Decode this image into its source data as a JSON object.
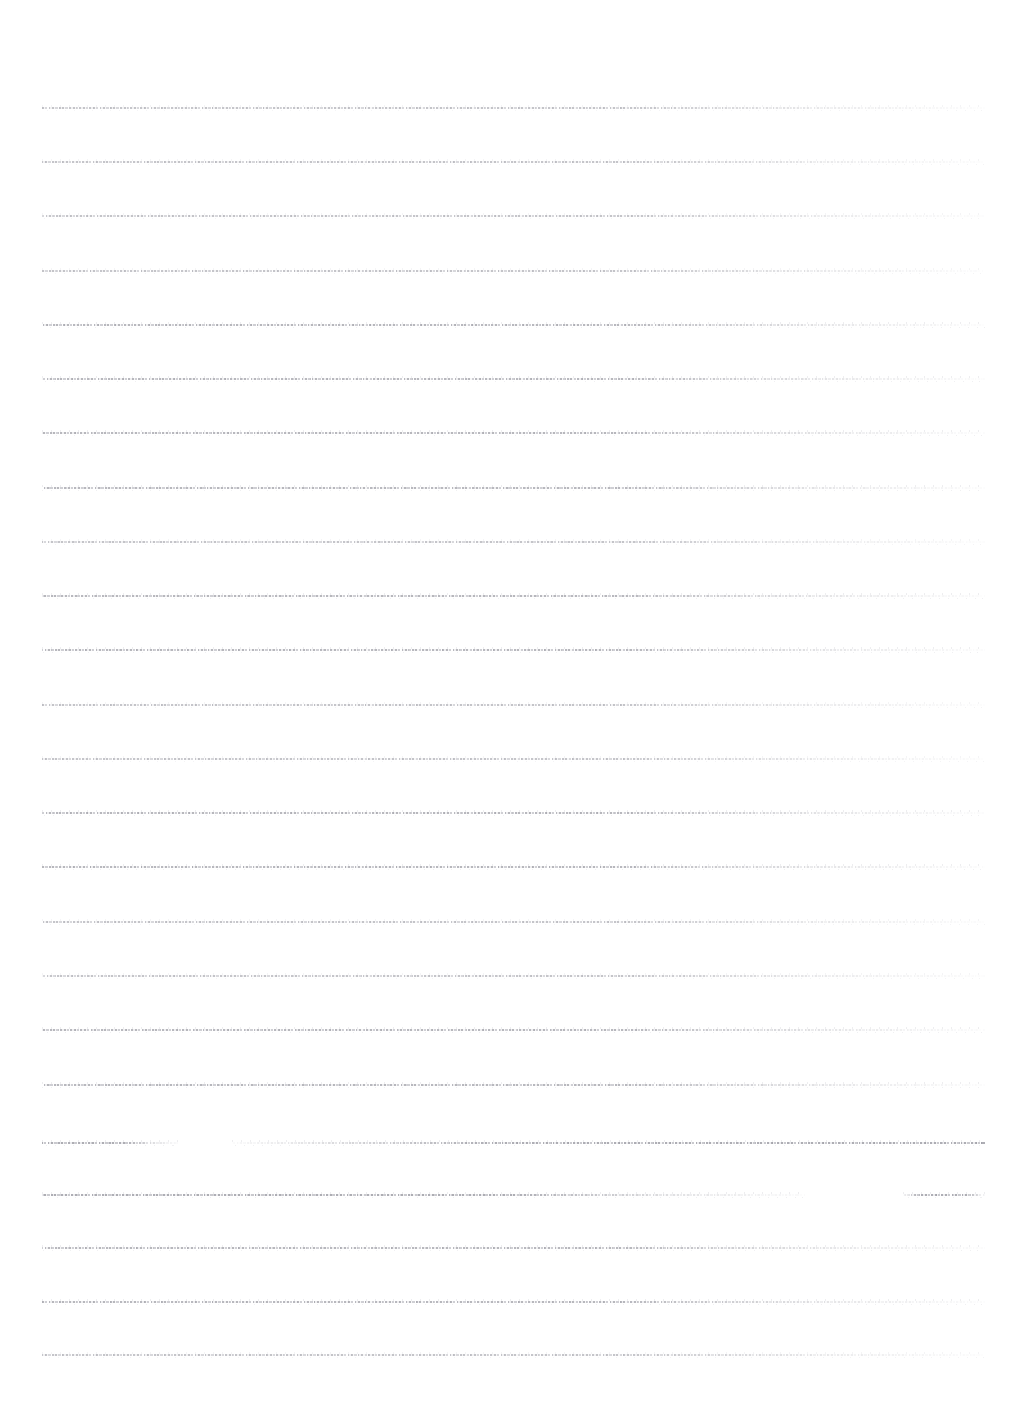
{
  "document": {
    "kind": "degraded-scanned-page",
    "page_width": 1027,
    "page_height": 1412,
    "background_color": "#ffffff",
    "ink_color": "#9696a0",
    "legibility": "illegible",
    "body_text": "",
    "margins": {
      "left": 42,
      "right": 42,
      "top": 108,
      "bottom": 57
    },
    "text_block": {
      "left": 42,
      "right": 985,
      "width": 943,
      "first_baseline": 108,
      "last_baseline": 1355
    },
    "typography": {
      "line_count": 24,
      "line_spacing": 54.2,
      "stroke_height": 2.2,
      "alignment": "justified"
    },
    "paragraphs": [
      {
        "index": 0,
        "start_line": 0,
        "end_line": 19
      },
      {
        "index": 1,
        "start_line": 19,
        "end_line": 21
      },
      {
        "index": 2,
        "start_line": 21,
        "end_line": 23
      }
    ],
    "lines": [
      {
        "y": 108,
        "density": "light",
        "runs": [
          {
            "x": 42,
            "w": 943,
            "fade": "tail-fade"
          }
        ]
      },
      {
        "y": 162,
        "density": "light",
        "runs": [
          {
            "x": 42,
            "w": 943,
            "fade": "tail-fade"
          }
        ]
      },
      {
        "y": 216,
        "density": "light",
        "runs": [
          {
            "x": 42,
            "w": 943,
            "fade": "tail-fade"
          }
        ]
      },
      {
        "y": 271,
        "density": "light",
        "runs": [
          {
            "x": 42,
            "w": 943,
            "fade": "tail-fade"
          }
        ]
      },
      {
        "y": 325,
        "density": "normal",
        "runs": [
          {
            "x": 42,
            "w": 943,
            "fade": "tail-fade"
          }
        ]
      },
      {
        "y": 379,
        "density": "normal",
        "runs": [
          {
            "x": 42,
            "w": 943,
            "fade": "tail-fade"
          }
        ]
      },
      {
        "y": 433,
        "density": "normal",
        "runs": [
          {
            "x": 42,
            "w": 943,
            "fade": "tail-fade"
          }
        ]
      },
      {
        "y": 488,
        "density": "normal",
        "runs": [
          {
            "x": 42,
            "w": 943,
            "fade": "tail-fade"
          }
        ]
      },
      {
        "y": 542,
        "density": "light",
        "runs": [
          {
            "x": 42,
            "w": 943,
            "fade": "tail-fade"
          }
        ]
      },
      {
        "y": 596,
        "density": "normal",
        "runs": [
          {
            "x": 42,
            "w": 943,
            "fade": "tail-fade"
          }
        ]
      },
      {
        "y": 650,
        "density": "normal",
        "runs": [
          {
            "x": 42,
            "w": 943,
            "fade": "tail-fade"
          }
        ]
      },
      {
        "y": 705,
        "density": "light",
        "runs": [
          {
            "x": 42,
            "w": 943,
            "fade": "tail-fade"
          }
        ]
      },
      {
        "y": 759,
        "density": "light",
        "runs": [
          {
            "x": 42,
            "w": 943,
            "fade": "tail-fade"
          }
        ]
      },
      {
        "y": 813,
        "density": "normal",
        "runs": [
          {
            "x": 42,
            "w": 943,
            "fade": "tail-fade"
          }
        ]
      },
      {
        "y": 867,
        "density": "normal",
        "runs": [
          {
            "x": 42,
            "w": 943,
            "fade": "tail-fade"
          }
        ]
      },
      {
        "y": 922,
        "density": "light",
        "runs": [
          {
            "x": 42,
            "w": 943,
            "fade": "tail-fade"
          }
        ]
      },
      {
        "y": 976,
        "density": "light",
        "runs": [
          {
            "x": 42,
            "w": 943,
            "fade": "tail-fade"
          }
        ]
      },
      {
        "y": 1030,
        "density": "normal",
        "runs": [
          {
            "x": 42,
            "w": 943,
            "fade": "tail-fade"
          }
        ]
      },
      {
        "y": 1085,
        "density": "normal",
        "runs": [
          {
            "x": 42,
            "w": 943,
            "fade": "tail-fade"
          }
        ]
      },
      {
        "y": 1143,
        "density": "dark",
        "runs": [
          {
            "x": 42,
            "w": 136,
            "fade": "tail-fade"
          },
          {
            "x": 232,
            "w": 753,
            "fade": "head-fade"
          }
        ]
      },
      {
        "y": 1195,
        "density": "dark",
        "runs": [
          {
            "x": 42,
            "w": 763,
            "fade": "tail-fade"
          },
          {
            "x": 903,
            "w": 82,
            "fade": "both-fade"
          }
        ]
      },
      {
        "y": 1248,
        "density": "normal",
        "runs": [
          {
            "x": 42,
            "w": 943,
            "fade": "tail-fade"
          }
        ]
      },
      {
        "y": 1302,
        "density": "normal",
        "runs": [
          {
            "x": 42,
            "w": 943,
            "fade": "tail-fade"
          }
        ]
      },
      {
        "y": 1355,
        "density": "light",
        "runs": [
          {
            "x": 42,
            "w": 943,
            "fade": "tail-fade"
          }
        ]
      }
    ]
  }
}
